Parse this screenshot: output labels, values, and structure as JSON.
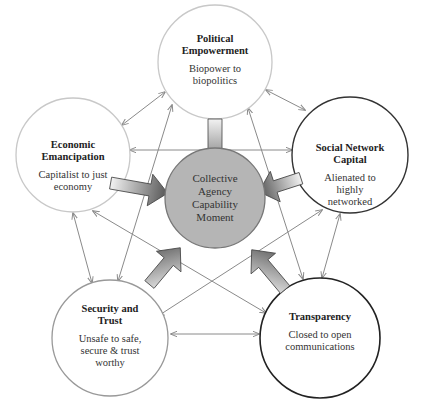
{
  "diagram": {
    "center": {
      "label_lines": [
        "Collective",
        "Agency",
        "Capability",
        "Moment"
      ],
      "fill": "#b5b5b5",
      "stroke": "#777777"
    },
    "nodes": [
      {
        "id": "political",
        "title_lines": [
          "Political",
          "Empowerment"
        ],
        "subtitle_lines": [
          "Biopower to",
          "biopolitics"
        ],
        "stroke": "#c8c8c8"
      },
      {
        "id": "economic",
        "title_lines": [
          "Economic",
          "Emancipation"
        ],
        "subtitle_lines": [
          "Capitalist to just",
          "economy"
        ],
        "stroke": "#c8c8c8"
      },
      {
        "id": "social",
        "title_lines": [
          "Social Network",
          "Capital"
        ],
        "subtitle_lines": [
          "Alienated to",
          "highly",
          "networked"
        ],
        "stroke": "#333333"
      },
      {
        "id": "security",
        "title_lines": [
          "Security and",
          "Trust"
        ],
        "subtitle_lines": [
          "Unsafe to safe,",
          "secure & trust",
          "worthy"
        ],
        "stroke": "#999999"
      },
      {
        "id": "transparency",
        "title_lines": [
          "Transparency"
        ],
        "subtitle_lines": [
          "Closed to open",
          "communications"
        ],
        "stroke": "#222222"
      }
    ],
    "connector_color": "#8a8a8a",
    "block_arrow_gradient": [
      "#f0f0f0",
      "#5a5a5a"
    ]
  }
}
